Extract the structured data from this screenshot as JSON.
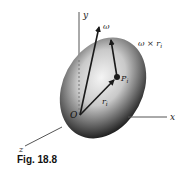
{
  "figure": {
    "caption": "Fig. 18.8",
    "labels": {
      "y_axis": "y",
      "x_axis": "x",
      "z_axis": "z",
      "omega": "ω",
      "omega_cross_r": "ω × r",
      "omega_cross_r_sub": "i",
      "point": "P",
      "point_sub": "i",
      "position_vector": "r",
      "position_vector_sub": "i",
      "origin": "O"
    },
    "colors": {
      "axis": "#555555",
      "vector": "#1a1a1a",
      "body_light": "#f2f2f2",
      "body_dark": "#1e1e1e",
      "text": "#222222"
    }
  }
}
